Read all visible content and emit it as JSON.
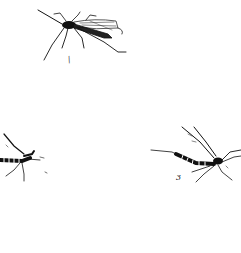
{
  "illustration": {
    "description": "Black-and-white line drawings of three mosquito-like insects on a white background",
    "background_color": "#ffffff",
    "ink_color": "#111111",
    "figures": [
      {
        "id": "insect-top",
        "label": "/",
        "pose": "adult with wings folded, facing left"
      },
      {
        "id": "insect-left",
        "label": "",
        "pose": "partially cropped at left edge, banded abdomen"
      },
      {
        "id": "insect-right",
        "label": "3",
        "pose": "banded abdomen, wings raised, facing right"
      }
    ]
  }
}
